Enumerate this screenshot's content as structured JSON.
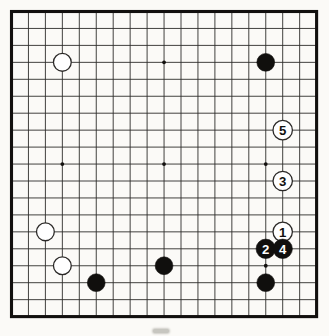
{
  "figure": {
    "kind": "go-game-diagram",
    "board_size": 19,
    "colors": {
      "paper": "#fbfaf7",
      "grid_line": "#2e2c2a",
      "border": "#12100e",
      "black_stone": "#100f0d",
      "white_stone": "#ffffff",
      "white_stone_outline": "#2b2927",
      "white_label_color": "#ffffff",
      "black_label_color": "#121110"
    },
    "star_points": [
      {
        "col": 9,
        "row": 3
      },
      {
        "col": 3,
        "row": 9
      },
      {
        "col": 9,
        "row": 9
      },
      {
        "col": 15,
        "row": 9
      },
      {
        "col": 15,
        "row": 15
      }
    ],
    "stones": [
      {
        "col": 3,
        "row": 3,
        "color": "white",
        "label": ""
      },
      {
        "col": 15,
        "row": 3,
        "color": "black",
        "label": ""
      },
      {
        "col": 16,
        "row": 7,
        "color": "white",
        "label": "5"
      },
      {
        "col": 16,
        "row": 10,
        "color": "white",
        "label": "3"
      },
      {
        "col": 2,
        "row": 13,
        "color": "white",
        "label": ""
      },
      {
        "col": 16,
        "row": 13,
        "color": "white",
        "label": "1"
      },
      {
        "col": 15,
        "row": 14,
        "color": "black",
        "label": "2"
      },
      {
        "col": 16,
        "row": 14,
        "color": "black",
        "label": "4"
      },
      {
        "col": 3,
        "row": 15,
        "color": "white",
        "label": ""
      },
      {
        "col": 9,
        "row": 15,
        "color": "black",
        "label": ""
      },
      {
        "col": 5,
        "row": 16,
        "color": "black",
        "label": ""
      },
      {
        "col": 15,
        "row": 16,
        "color": "black",
        "label": ""
      }
    ],
    "move_sequence": [
      {
        "number": "1",
        "color": "white",
        "col": 16,
        "row": 13
      },
      {
        "number": "2",
        "color": "black",
        "col": 15,
        "row": 14
      },
      {
        "number": "3",
        "color": "white",
        "col": 16,
        "row": 10
      },
      {
        "number": "4",
        "color": "black",
        "col": 16,
        "row": 14
      },
      {
        "number": "5",
        "color": "white",
        "col": 16,
        "row": 7
      }
    ]
  }
}
